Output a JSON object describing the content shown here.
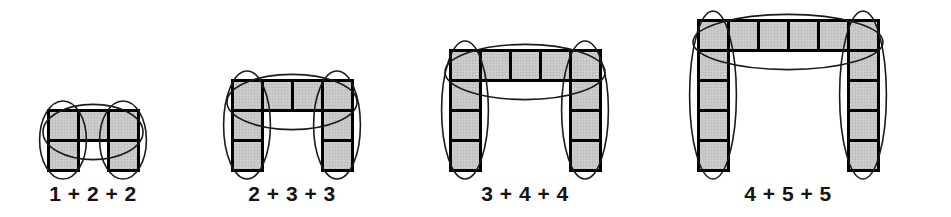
{
  "canvas": {
    "width": 951,
    "height": 217,
    "background": "#ffffff"
  },
  "style": {
    "cell_fill": "#c9c9c9",
    "cell_stroke": "#000000",
    "cell_stroke_width": 3,
    "ellipse_stroke": "#1a1a1a",
    "ellipse_stroke_width": 1.6,
    "label_color": "#141414",
    "cell_size": 30
  },
  "chart_data": {
    "type": "diagram",
    "title": "",
    "figures": [
      {
        "id": "figure-1",
        "label": "1 + 2 + 2",
        "columns": 3,
        "rows": 2,
        "cell_size": 30,
        "origin_x": 48,
        "baseline_y": 170,
        "parts": [
          1,
          2,
          2
        ],
        "total": 5,
        "groups": [
          {
            "name": "left-leg",
            "count": 2
          },
          {
            "name": "top-row",
            "count": 3
          },
          {
            "name": "right-leg",
            "count": 2
          }
        ]
      },
      {
        "id": "figure-2",
        "label": "2 + 3 + 3",
        "columns": 4,
        "rows": 3,
        "cell_size": 30,
        "origin_x": 232,
        "baseline_y": 170,
        "parts": [
          2,
          3,
          3
        ],
        "total": 8,
        "groups": [
          {
            "name": "left-leg",
            "count": 3
          },
          {
            "name": "top-row",
            "count": 4
          },
          {
            "name": "right-leg",
            "count": 3
          }
        ]
      },
      {
        "id": "figure-3",
        "label": "3 + 4 + 4",
        "columns": 5,
        "rows": 4,
        "cell_size": 30,
        "origin_x": 450,
        "baseline_y": 170,
        "parts": [
          3,
          4,
          4
        ],
        "total": 11,
        "groups": [
          {
            "name": "left-leg",
            "count": 4
          },
          {
            "name": "top-row",
            "count": 5
          },
          {
            "name": "right-leg",
            "count": 4
          }
        ]
      },
      {
        "id": "figure-4",
        "label": "4 + 5 + 5",
        "columns": 6,
        "rows": 5,
        "cell_size": 30,
        "origin_x": 698,
        "baseline_y": 170,
        "parts": [
          4,
          5,
          5
        ],
        "total": 14,
        "groups": [
          {
            "name": "left-leg",
            "count": 5
          },
          {
            "name": "top-row",
            "count": 6
          },
          {
            "name": "right-leg",
            "count": 5
          }
        ]
      }
    ]
  }
}
